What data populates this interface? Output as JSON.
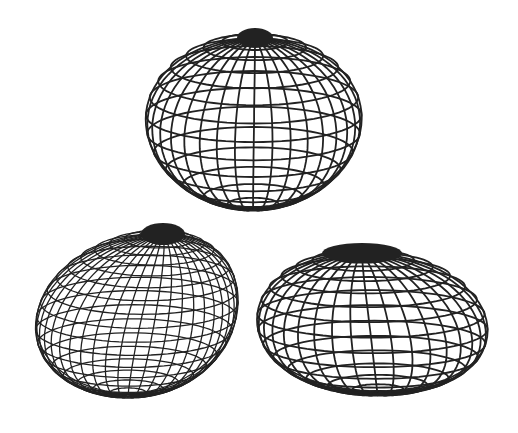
{
  "figure": {
    "background": "#ffffff",
    "stroke_color": "#222222",
    "shapes": [
      {
        "id": "wireframe-top",
        "cx": 253,
        "cy": 110,
        "rx": 108,
        "ry": 97,
        "pole_x": 255,
        "pole_y": 38,
        "pole_rx": 18,
        "pole_ry": 10,
        "meridians": 36,
        "parallels": 15,
        "squash": 0.0,
        "skew": 0.0,
        "stroke_width": 1.8
      },
      {
        "id": "wireframe-bottom-left",
        "cx": 128,
        "cy": 310,
        "rx": 100,
        "ry": 92,
        "pole_x": 163,
        "pole_y": 234,
        "pole_rx": 22,
        "pole_ry": 11,
        "meridians": 44,
        "parallels": 20,
        "squash": 0.15,
        "skew": -0.25,
        "stroke_width": 1.3
      },
      {
        "id": "wireframe-bottom-right",
        "cx": 378,
        "cy": 318,
        "rx": 115,
        "ry": 86,
        "pole_x": 362,
        "pole_y": 253,
        "pole_rx": 40,
        "pole_ry": 10,
        "meridians": 36,
        "parallels": 16,
        "squash": 0.25,
        "skew": 0.0,
        "stroke_width": 1.8
      }
    ]
  }
}
